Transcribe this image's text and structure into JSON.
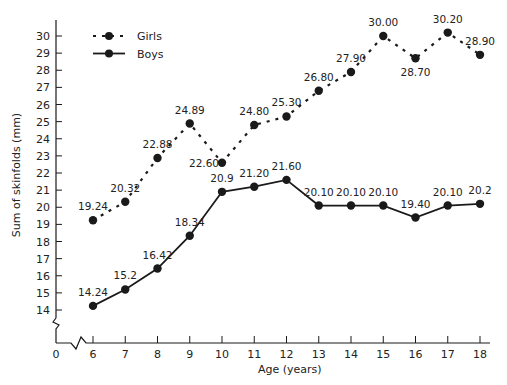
{
  "chart_data": {
    "type": "line",
    "title": "",
    "xlabel": "Age (years)",
    "ylabel": "Sum of skinfolds (mm)",
    "x": [
      6,
      7,
      8,
      9,
      10,
      11,
      12,
      13,
      14,
      15,
      16,
      17,
      18
    ],
    "x_ticks": [
      0,
      6,
      7,
      8,
      9,
      10,
      11,
      12,
      13,
      14,
      15,
      16,
      17,
      18
    ],
    "y_ticks": [
      14,
      15,
      16,
      17,
      18,
      19,
      20,
      21,
      22,
      23,
      24,
      25,
      26,
      27,
      28,
      29,
      30
    ],
    "ylim": [
      14,
      30
    ],
    "axis_break": true,
    "grid": false,
    "legend_position": "upper-left",
    "series": [
      {
        "name": "Girls",
        "style": "dashed",
        "values": [
          19.24,
          20.32,
          22.88,
          24.89,
          22.6,
          24.8,
          25.3,
          26.8,
          27.9,
          30.0,
          28.7,
          30.2,
          28.9
        ],
        "labels": [
          "19.24",
          "20.32",
          "22.88",
          "24.89",
          "22.60",
          "24.80",
          "25.30",
          "26.80",
          "27.90",
          "30.00",
          "28.70",
          "30.20",
          "28.90"
        ]
      },
      {
        "name": "Boys",
        "style": "solid",
        "values": [
          14.24,
          15.2,
          16.42,
          18.34,
          20.9,
          21.2,
          21.6,
          20.1,
          20.1,
          20.1,
          19.4,
          20.1,
          20.2
        ],
        "labels": [
          "14.24",
          "15.2",
          "16.42",
          "18.34",
          "20.9",
          "21.20",
          "21.60",
          "20.10",
          "20.10",
          "20.10",
          "19.40",
          "20.10",
          "20.2"
        ]
      }
    ]
  },
  "colors": {
    "ink": "#1a1a1a"
  }
}
